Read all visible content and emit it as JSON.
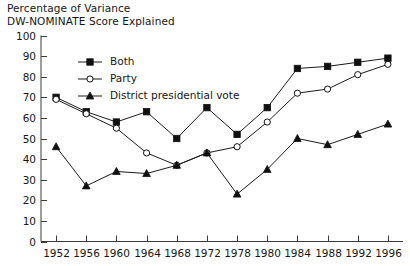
{
  "figure": {
    "title_lines": [
      "Percentage of Variance",
      "DW-NOMINATE Score Explained"
    ]
  },
  "legend": {
    "position": "top-left-inside",
    "entries": [
      {
        "label": "Both",
        "marker": "filled-square"
      },
      {
        "label": "Party",
        "marker": "open-circle"
      },
      {
        "label": "District presidential vote",
        "marker": "filled-triangle"
      }
    ]
  },
  "axes": {
    "y_ticks": [
      "0",
      "10",
      "20",
      "30",
      "40",
      "50",
      "60",
      "70",
      "80",
      "90",
      "100"
    ],
    "x_ticks": [
      "1952",
      "1956",
      "1960",
      "1964",
      "1968",
      "1972",
      "1978",
      "1980",
      "1984",
      "1988",
      "1992",
      "1996"
    ]
  },
  "chart_data": {
    "type": "line",
    "title": "Percentage of Variance DW-NOMINATE Score Explained",
    "xlabel": "",
    "ylabel": "",
    "ylim": [
      0,
      100
    ],
    "grid": false,
    "legend_position": "top-left-inside",
    "categories": [
      "1952",
      "1956",
      "1960",
      "1964",
      "1968",
      "1972",
      "1978",
      "1980",
      "1984",
      "1988",
      "1992",
      "1996"
    ],
    "series": [
      {
        "name": "Both",
        "marker": "filled-square",
        "values": [
          70,
          63,
          58,
          63,
          50,
          65,
          52,
          65,
          84,
          85,
          87,
          89
        ]
      },
      {
        "name": "Party",
        "marker": "open-circle",
        "values": [
          69,
          62,
          55,
          43,
          37,
          43,
          46,
          58,
          72,
          74,
          81,
          86
        ]
      },
      {
        "name": "District presidential vote",
        "marker": "filled-triangle",
        "values": [
          46,
          27,
          34,
          33,
          37,
          43,
          23,
          35,
          50,
          47,
          52,
          57
        ]
      }
    ]
  },
  "colors": {
    "ink": "#101010",
    "axis": "#3a3a3a",
    "background": "#ffffff"
  }
}
